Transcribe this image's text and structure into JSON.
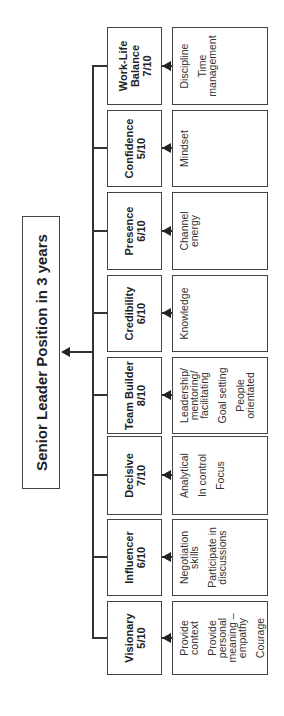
{
  "title": "Senior Leader Position in 3 years",
  "columns": [
    {
      "name": "Visionary",
      "score": "5/10",
      "items": [
        "Provide\ncontext",
        "Provide\npersonal\nmeaning –\nempathy",
        "Courage"
      ]
    },
    {
      "name": "Influencer",
      "score": "6/10",
      "items": [
        "Negotiation\nskills",
        "Participate in\ndiscussions"
      ]
    },
    {
      "name": "Decisive",
      "score": "7/10",
      "items": [
        "Analytical",
        "In control",
        "Focus"
      ]
    },
    {
      "name": "Team Builder",
      "score": "8/10",
      "items": [
        "Leadership/\nmentoring/\nfacilitating",
        "Goal setting",
        "People\norientated"
      ]
    },
    {
      "name": "Credibility",
      "score": "6/10",
      "items": [
        "Knowledge"
      ]
    },
    {
      "name": "Presence",
      "score": "6/10",
      "items": [
        "Channel\nenergy"
      ]
    },
    {
      "name": "Confidence",
      "score": "5/10",
      "items": [
        "Mindset"
      ]
    },
    {
      "name": "Work-Life\nBalance",
      "score": "7/10",
      "items": [
        "Discipline",
        "Time\nmanagement"
      ]
    }
  ],
  "colors": {
    "line": "#333333",
    "border": "#444444",
    "text": "#222222",
    "background": "#ffffff"
  }
}
